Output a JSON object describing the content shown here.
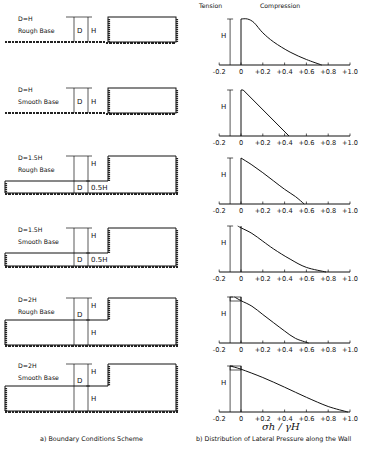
{
  "figure": {
    "caption_a": "a) Boundary Conditions Scheme",
    "caption_b": "b) Distribution of Lateral Pressure along the Wall",
    "x_axis_label": "σh / γH",
    "tension_label": "Tension",
    "compression_label": "Compression"
  },
  "cases": [
    {
      "depth_label": "D=H",
      "base_label": "Rough Base",
      "d_label": "D",
      "h_label": "H",
      "extra_label": ""
    },
    {
      "depth_label": "D=H",
      "base_label": "Smooth Base",
      "d_label": "D",
      "h_label": "H",
      "extra_label": ""
    },
    {
      "depth_label": "D=1.5H",
      "base_label": "Rough Base",
      "d_label": "D",
      "h_label": "H",
      "extra_label": "0.5H"
    },
    {
      "depth_label": "D=1.5H",
      "base_label": "Smooth Base",
      "d_label": "D",
      "h_label": "H",
      "extra_label": "0.5H"
    },
    {
      "depth_label": "D=2H",
      "base_label": "Rough Base",
      "d_label": "D",
      "h_label": "H",
      "extra_label": "H"
    },
    {
      "depth_label": "D=2H",
      "base_label": "Smooth Base",
      "d_label": "D",
      "h_label": "H",
      "extra_label": "H"
    }
  ],
  "chart_data": {
    "type": "line",
    "title": "Distribution of Lateral Pressure along the Wall",
    "xlabel": "σh / γH",
    "ylabel": "H",
    "xlim": [
      -0.2,
      1.0
    ],
    "x_ticks": [
      "-0.2",
      "0",
      "+0.2",
      "+0.4",
      "+0.6",
      "+0.8",
      "+1.0"
    ],
    "note": "Each panel: y is fraction of wall height from top (0=top, 1=bottom), x is normalized lateral pressure",
    "series": [
      {
        "name": "D=H Rough Base",
        "points": [
          [
            0,
            0
          ],
          [
            0.06,
            0
          ],
          [
            0.12,
            0.08
          ],
          [
            0.2,
            0.3
          ],
          [
            0.3,
            0.5
          ],
          [
            0.45,
            0.72
          ],
          [
            0.6,
            0.88
          ],
          [
            0.74,
            1.0
          ]
        ]
      },
      {
        "name": "D=H Smooth Base",
        "points": [
          [
            0,
            0
          ],
          [
            0.02,
            0
          ],
          [
            0.44,
            1.0
          ]
        ]
      },
      {
        "name": "D=1.5H Rough Base",
        "points": [
          [
            0,
            0
          ],
          [
            0.1,
            0.15
          ],
          [
            0.2,
            0.32
          ],
          [
            0.3,
            0.5
          ],
          [
            0.4,
            0.68
          ],
          [
            0.5,
            0.84
          ],
          [
            0.58,
            1.0
          ]
        ]
      },
      {
        "name": "D=1.5H Smooth Base",
        "points": [
          [
            -0.03,
            0
          ],
          [
            0,
            0.04
          ],
          [
            0.1,
            0.16
          ],
          [
            0.2,
            0.33
          ],
          [
            0.3,
            0.5
          ],
          [
            0.45,
            0.72
          ],
          [
            0.6,
            0.9
          ],
          [
            0.78,
            1.0
          ]
        ]
      },
      {
        "name": "D=2H Rough Base",
        "points": [
          [
            -0.06,
            0
          ],
          [
            0,
            0.08
          ],
          [
            0.1,
            0.2
          ],
          [
            0.2,
            0.38
          ],
          [
            0.3,
            0.56
          ],
          [
            0.4,
            0.74
          ],
          [
            0.5,
            0.9
          ],
          [
            0.62,
            1.0
          ]
        ]
      },
      {
        "name": "D=2H Smooth Base",
        "points": [
          [
            -0.1,
            0
          ],
          [
            0,
            0.07
          ],
          [
            0.2,
            0.25
          ],
          [
            0.4,
            0.46
          ],
          [
            0.6,
            0.68
          ],
          [
            0.8,
            0.88
          ],
          [
            0.98,
            1.0
          ]
        ]
      }
    ],
    "tension_box": [
      {
        "case": "D=2H Rough Base",
        "x_from": -0.1,
        "x_to": 0
      },
      {
        "case": "D=2H Smooth Base",
        "x_from": -0.1,
        "x_to": 0
      }
    ]
  }
}
